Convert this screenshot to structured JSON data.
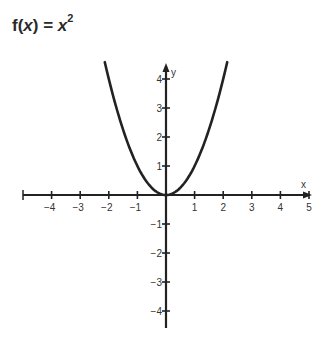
{
  "title": {
    "prefix": "f(",
    "var": "x",
    "mid": ") = ",
    "base": "x",
    "exp": "2"
  },
  "axes": {
    "x_label": "x",
    "y_label": "y"
  },
  "chart_data": {
    "type": "line",
    "function": "x^2",
    "xlabel": "x",
    "ylabel": "y",
    "xlim": [
      -5,
      5
    ],
    "ylim": [
      -4.5,
      4.5
    ],
    "x_ticks": [
      -4,
      -3,
      -2,
      -1,
      1,
      2,
      3,
      4,
      5
    ],
    "y_ticks": [
      4,
      3,
      2,
      1,
      -1,
      -2,
      -3,
      -4
    ],
    "grid": false,
    "series": [
      {
        "name": "f(x) = x^2",
        "x": [
          -2.14,
          -2,
          -1.5,
          -1,
          -0.5,
          0,
          0.5,
          1,
          1.5,
          2,
          2.14
        ],
        "y": [
          4.58,
          4,
          2.25,
          1,
          0.25,
          0,
          0.25,
          1,
          2.25,
          4,
          4.58
        ]
      }
    ],
    "colors": {
      "curve": "#222222",
      "axes": "#222222",
      "labels": "#333333"
    }
  }
}
